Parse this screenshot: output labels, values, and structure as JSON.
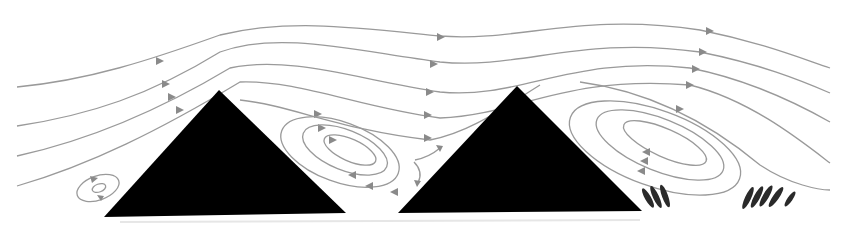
{
  "diagram": {
    "type": "flow-over-bedforms",
    "colors": {
      "background": "#ffffff",
      "dune": "#000000",
      "streamline": "#9a9a9a",
      "arrow": "#8a8a8a",
      "fish": "#2a2a2a"
    },
    "elements": {
      "dunes": [
        {
          "name": "dune-left",
          "peak": [
            219,
            90
          ],
          "base": [
            [
              104,
              217
            ],
            [
              346,
              213
            ]
          ]
        },
        {
          "name": "dune-right",
          "peak": [
            517,
            86
          ],
          "base": [
            [
              398,
              213
            ],
            [
              642,
              211
            ]
          ]
        }
      ],
      "eddies": [
        {
          "name": "eddy-upstream-small",
          "center": [
            98,
            188
          ]
        },
        {
          "name": "eddy-lee-left",
          "center": [
            340,
            150
          ]
        },
        {
          "name": "eddy-lee-right",
          "center": [
            660,
            145
          ]
        }
      ],
      "fish_groups": [
        {
          "name": "fish-group-near",
          "count": 3
        },
        {
          "name": "fish-group-far",
          "count": 5
        }
      ],
      "flow_direction": "left-to-right"
    }
  }
}
